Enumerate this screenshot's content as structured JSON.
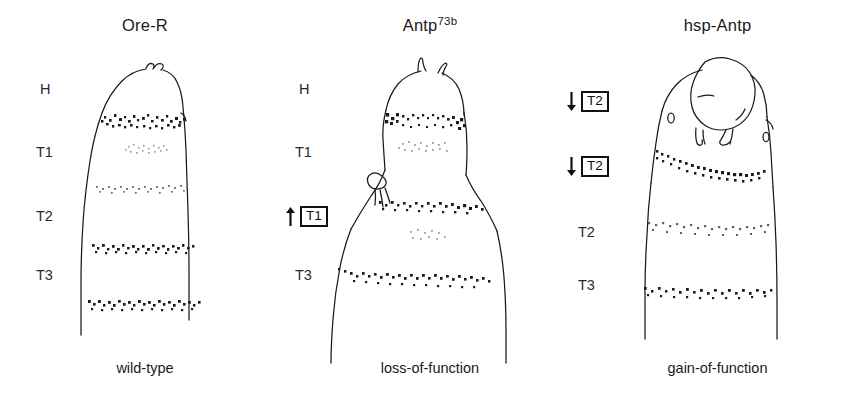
{
  "figure": {
    "background_color": "#ffffff",
    "ink_color": "#1a1a1a",
    "width": 865,
    "height": 417
  },
  "panels": [
    {
      "id": "wild-type",
      "title": "Ore-R",
      "title_superscript": "",
      "caption": "wild-type",
      "segment_labels": [
        {
          "text": "H",
          "x": 40,
          "y": 82
        },
        {
          "text": "T1",
          "x": 36,
          "y": 145
        },
        {
          "text": "T2",
          "x": 36,
          "y": 209
        },
        {
          "text": "T3",
          "x": 36,
          "y": 268
        }
      ],
      "annotations": []
    },
    {
      "id": "loss-of-function",
      "title": "Antp",
      "title_superscript": "73b",
      "caption": "loss-of-function",
      "segment_labels": [
        {
          "text": "H",
          "x": 299,
          "y": 82
        },
        {
          "text": "T1",
          "x": 295,
          "y": 145
        },
        {
          "text": "T3",
          "x": 295,
          "y": 268
        }
      ],
      "annotations": [
        {
          "direction": "up",
          "boxed_text": "T1",
          "x": 285,
          "y": 206
        }
      ]
    },
    {
      "id": "gain-of-function",
      "title": "hsp-Antp",
      "title_superscript": "",
      "caption": "gain-of-function",
      "segment_labels": [
        {
          "text": "T2",
          "x": 578,
          "y": 225
        },
        {
          "text": "T3",
          "x": 578,
          "y": 278
        }
      ],
      "annotations": [
        {
          "direction": "down",
          "boxed_text": "T2",
          "x": 566,
          "y": 91
        },
        {
          "direction": "down",
          "boxed_text": "T2",
          "x": 566,
          "y": 156
        }
      ]
    }
  ]
}
